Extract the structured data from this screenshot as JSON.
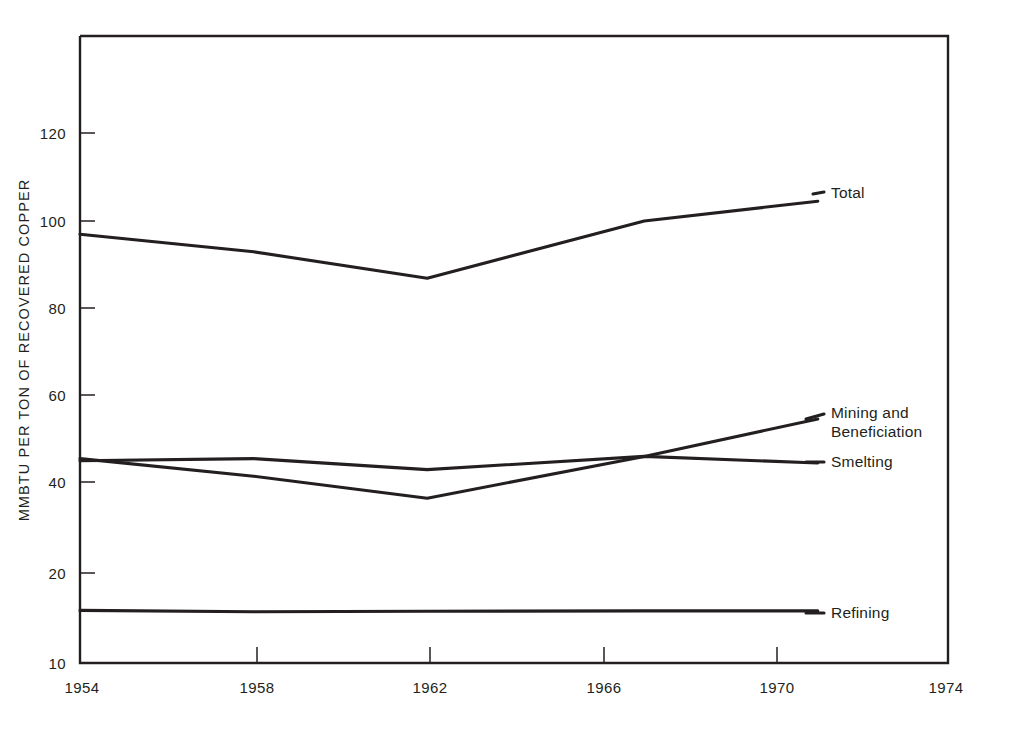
{
  "chart_data": {
    "type": "line",
    "title": "",
    "xlabel": "",
    "ylabel": "MMBTU PER TON OF RECOVERED COPPER",
    "x": [
      1954,
      1958,
      1962,
      1967,
      1971
    ],
    "xlim": [
      1954,
      1974
    ],
    "ylim": [
      10,
      130
    ],
    "grid": false,
    "legend_position": "right-inline-labels",
    "x_tick_labels": [
      "1954",
      "1958",
      "1962",
      "1966",
      "1970",
      "1974"
    ],
    "x_ticks": [
      1954,
      1958,
      1962,
      1966,
      1970,
      1974
    ],
    "y_tick_labels": [
      "120",
      "100",
      "80",
      "60",
      "40",
      "20",
      "10"
    ],
    "y_ticks": [
      120,
      100,
      80,
      60,
      40,
      20,
      10
    ],
    "series": [
      {
        "name": "Total",
        "label": "Total",
        "color": "#231f20",
        "x": [
          1954,
          1958,
          1962,
          1967,
          1971
        ],
        "values": [
          97,
          93,
          87,
          100,
          104.5
        ]
      },
      {
        "name": "Mining and Beneficiation",
        "label": "Mining and\nBeneficiation",
        "label_line1": "Mining and",
        "label_line2": "Beneficiation",
        "color": "#231f20",
        "x": [
          1954,
          1958,
          1962,
          1967,
          1971
        ],
        "values": [
          46,
          42,
          37,
          46.5,
          55
        ]
      },
      {
        "name": "Smelting",
        "label": "Smelting",
        "color": "#231f20",
        "x": [
          1954,
          1958,
          1962,
          1967,
          1971
        ],
        "values": [
          45.5,
          46,
          43.5,
          46.5,
          45
        ]
      },
      {
        "name": "Refining",
        "label": "Refining",
        "color": "#231f20",
        "x": [
          1954,
          1958,
          1962,
          1967,
          1971
        ],
        "values": [
          11.5,
          11.2,
          11.3,
          11.4,
          11.4
        ]
      }
    ]
  },
  "axis": {
    "y_title": "MMBTU PER TON OF RECOVERED COPPER",
    "y_labels": [
      "120",
      "100",
      "80",
      "60",
      "40",
      "20",
      "10"
    ],
    "x_labels": [
      "1954",
      "1958",
      "1962",
      "1966",
      "1970",
      "1974"
    ]
  },
  "labels": {
    "total": "Total",
    "mining_line1": "Mining and",
    "mining_line2": "Beneficiation",
    "smelting": "Smelting",
    "refining": "Refining"
  }
}
